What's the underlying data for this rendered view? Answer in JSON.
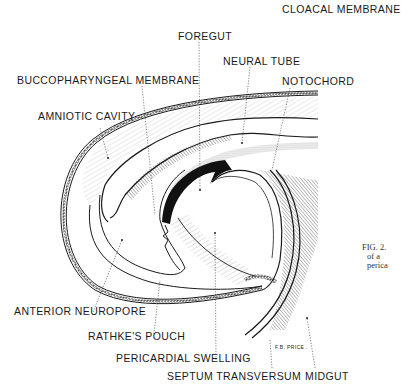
{
  "figure": {
    "labels": {
      "cloacal_membrane": "CLOACAL MEMBRANE",
      "foregut": "FOREGUT",
      "neural_tube": "NEURAL TUBE",
      "buccopharyngeal_membrane": "BUCCOPHARYNGEAL MEMBRANE",
      "notochord": "NOTOCHORD",
      "amniotic_cavity": "AMNIOTIC CAVITY",
      "anterior_neuropore": "ANTERIOR NEUROPORE",
      "rathkes_pouch": "RATHKE'S POUCH",
      "pericardial_swelling": "PERICARDIAL SWELLING",
      "septum_transversum": "SEPTUM TRANSVERSUM",
      "midgut": "MIDGUT"
    },
    "artist_signature": "F.B. PRICE .",
    "caption": {
      "line1": "FIG. 2.",
      "line2": "of a",
      "line3": "perica"
    },
    "colors": {
      "ink": "#1a1a1a",
      "background": "#ffffff"
    }
  }
}
